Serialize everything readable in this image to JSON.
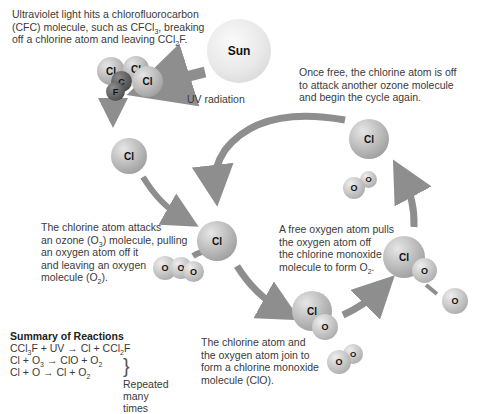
{
  "captions": {
    "uv_hit": [
      "Ultraviolet light hits a chlorofluorocarbon",
      "(CFC) molecule, such as CFCl",
      "3",
      ", breaking",
      "off a chlorine atom and leaving CCl",
      "2",
      "F."
    ],
    "uv_radiation": "UV radiation",
    "sun": "Sun",
    "once_free": [
      "Once free, the chlorine atom is off",
      "to attack another ozone molecule",
      "and begin the cycle again."
    ],
    "attacks": [
      "The chlorine atom attacks",
      "an ozone (O",
      "3",
      ") molecule, pulling",
      "an oxygen atom off it",
      "and leaving an oxygen",
      "molecule (O",
      "2",
      ")."
    ],
    "free_oxygen": [
      "A free oxygen atom pulls",
      "the oxygen atom off",
      "the chlorine monoxide",
      "molecule to form O",
      "2",
      "."
    ],
    "join": [
      "The chlorine atom and",
      "the oxygen atom join to",
      "form a chlorine monoxide",
      "molecule (ClO)."
    ]
  },
  "atoms": {
    "cl": "Cl",
    "o": "O",
    "c": "C",
    "f": "F"
  },
  "summary": {
    "title": "Summary of Reactions",
    "r1": [
      "CCl",
      "3",
      "F + UV",
      "→",
      "Cl + CCl",
      "2",
      "F"
    ],
    "r2": [
      "Cl + O",
      "3",
      "→",
      "ClO + O",
      "2"
    ],
    "r3": [
      "Cl + O",
      "→",
      "Cl + O",
      "2"
    ],
    "brace_label": [
      "Repeated",
      "many times"
    ]
  },
  "colors": {
    "arrow": "#8e8e8e",
    "text": "#3a3a3a"
  }
}
